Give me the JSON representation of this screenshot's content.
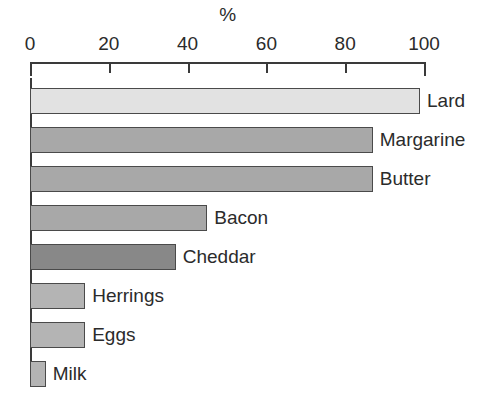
{
  "chart_data": {
    "type": "bar",
    "orientation": "horizontal",
    "title": "",
    "xlabel": "%",
    "ylabel": "",
    "xlim": [
      0,
      100
    ],
    "grid": false,
    "legend": null,
    "categories": [
      "Lard",
      "Margarine",
      "Butter",
      "Bacon",
      "Cheddar",
      "Herrings",
      "Eggs",
      "Milk"
    ],
    "values": [
      99,
      87,
      87,
      45,
      37,
      14,
      14,
      4
    ],
    "tick_labels": [
      "0",
      "20",
      "40",
      "60",
      "80",
      "100"
    ],
    "tick_values": [
      0,
      20,
      40,
      60,
      80,
      100
    ],
    "bars": [
      {
        "label": "Lard",
        "value": 99,
        "color": "#e2e2e2"
      },
      {
        "label": "Margarine",
        "value": 87,
        "color": "#a8a8a8"
      },
      {
        "label": "Butter",
        "value": 87,
        "color": "#a8a8a8"
      },
      {
        "label": "Bacon",
        "value": 45,
        "color": "#a8a8a8"
      },
      {
        "label": "Cheddar",
        "value": 37,
        "color": "#888888"
      },
      {
        "label": "Herrings",
        "value": 14,
        "color": "#b4b4b4"
      },
      {
        "label": "Eggs",
        "value": 14,
        "color": "#b4b4b4"
      },
      {
        "label": "Milk",
        "value": 4,
        "color": "#b4b4b4"
      }
    ],
    "colors": {
      "axis": "#3a3a3a",
      "bar_outline": "#4a4a4a",
      "text": "#2b2b2b",
      "background": "#ffffff"
    }
  }
}
